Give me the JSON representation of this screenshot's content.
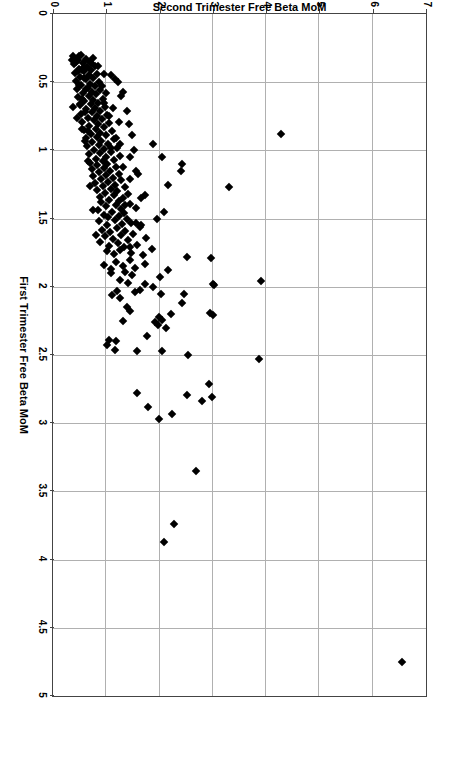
{
  "figure": {
    "rotation_note": "page-rotated-90-clockwise",
    "background": "#ffffff",
    "frame_color": "#444444",
    "grid_color": "#b0b0b0",
    "marker_color": "#000000"
  },
  "chart_data": {
    "type": "scatter",
    "title": "",
    "xlabel": "First Trimester Free Beta MoM",
    "ylabel": "Second Trimester Free Beta MoM",
    "xlim": [
      0,
      5
    ],
    "ylim": [
      0,
      7
    ],
    "xticks": [
      "0",
      "0.5",
      "1",
      "1.5",
      "2",
      "2.5",
      "3",
      "3.5",
      "4",
      "4.5",
      "5"
    ],
    "xtick_values": [
      0,
      0.5,
      1,
      1.5,
      2,
      2.5,
      3,
      3.5,
      4,
      4.5,
      5
    ],
    "yticks": [
      "0",
      "1",
      "2",
      "3",
      "4",
      "5",
      "6",
      "7"
    ],
    "ytick_values": [
      0,
      1,
      2,
      3,
      4,
      5,
      6,
      7
    ],
    "grid": true,
    "legend": null,
    "marker": "diamond",
    "marker_size_px": 6,
    "n_points": 268,
    "points": [
      [
        4.75,
        6.55
      ],
      [
        3.87,
        2.08
      ],
      [
        3.74,
        2.28
      ],
      [
        3.35,
        2.68
      ],
      [
        2.97,
        1.99
      ],
      [
        2.93,
        2.24
      ],
      [
        2.88,
        1.79
      ],
      [
        2.84,
        2.79
      ],
      [
        2.81,
        2.99
      ],
      [
        2.79,
        2.51
      ],
      [
        2.78,
        1.58
      ],
      [
        2.71,
        2.92
      ],
      [
        2.53,
        3.87
      ],
      [
        2.5,
        2.54
      ],
      [
        2.47,
        2.05
      ],
      [
        2.47,
        1.57
      ],
      [
        2.46,
        1.17
      ],
      [
        2.43,
        1.02
      ],
      [
        2.4,
        1.18
      ],
      [
        2.39,
        1.05
      ],
      [
        2.36,
        1.77
      ],
      [
        2.3,
        2.12
      ],
      [
        2.28,
        1.97
      ],
      [
        2.26,
        1.92
      ],
      [
        2.25,
        1.32
      ],
      [
        2.24,
        2.04
      ],
      [
        2.22,
        1.98
      ],
      [
        2.21,
        3.01
      ],
      [
        2.19,
        2.94
      ],
      [
        2.18,
        1.44
      ],
      [
        2.15,
        1.38
      ],
      [
        2.12,
        2.43
      ],
      [
        2.08,
        1.26
      ],
      [
        2.06,
        1.1
      ],
      [
        2.05,
        2.46
      ],
      [
        2.05,
        2.02
      ],
      [
        2.04,
        1.53
      ],
      [
        2.03,
        1.21
      ],
      [
        2.02,
        1.63
      ],
      [
        2.0,
        1.88
      ],
      [
        1.99,
        3.03
      ],
      [
        1.98,
        1.73
      ],
      [
        1.97,
        1.41
      ],
      [
        1.96,
        3.91
      ],
      [
        1.95,
        1.25
      ],
      [
        1.93,
        2.01
      ],
      [
        1.91,
        1.49
      ],
      [
        1.9,
        1.09
      ],
      [
        1.89,
        1.36
      ],
      [
        1.88,
        2.16
      ],
      [
        1.87,
        1.08
      ],
      [
        1.86,
        1.54
      ],
      [
        1.85,
        1.31
      ],
      [
        1.84,
        0.95
      ],
      [
        1.83,
        1.72
      ],
      [
        1.82,
        1.19
      ],
      [
        1.8,
        1.44
      ],
      [
        1.79,
        2.97
      ],
      [
        1.78,
        2.52
      ],
      [
        1.77,
        1.69
      ],
      [
        1.76,
        1.14
      ],
      [
        1.75,
        1.46
      ],
      [
        1.74,
        1.02
      ],
      [
        1.73,
        1.25
      ],
      [
        1.72,
        1.85
      ],
      [
        1.71,
        1.34
      ],
      [
        1.7,
        1.05
      ],
      [
        1.69,
        1.58
      ],
      [
        1.68,
        1.22
      ],
      [
        1.67,
        0.89
      ],
      [
        1.66,
        1.41
      ],
      [
        1.65,
        1.13
      ],
      [
        1.64,
        1.74
      ],
      [
        1.63,
        0.98
      ],
      [
        1.62,
        1.28
      ],
      [
        1.61,
        1.51
      ],
      [
        1.6,
        1.07
      ],
      [
        1.59,
        1.36
      ],
      [
        1.58,
        0.92
      ],
      [
        1.57,
        1.2
      ],
      [
        1.56,
        1.63
      ],
      [
        1.55,
        1.01
      ],
      [
        1.54,
        1.3
      ],
      [
        1.53,
        1.47
      ],
      [
        1.52,
        0.87
      ],
      [
        1.51,
        1.16
      ],
      [
        1.5,
        1.39
      ],
      [
        1.49,
        1.04
      ],
      [
        1.48,
        1.24
      ],
      [
        1.47,
        0.96
      ],
      [
        1.46,
        1.33
      ],
      [
        1.45,
        1.1
      ],
      [
        1.44,
        0.84
      ],
      [
        1.43,
        1.27
      ],
      [
        1.42,
        1.55
      ],
      [
        1.41,
        0.99
      ],
      [
        1.4,
        1.18
      ],
      [
        1.39,
        1.44
      ],
      [
        1.38,
        0.91
      ],
      [
        1.37,
        1.23
      ],
      [
        1.36,
        1.06
      ],
      [
        1.35,
        1.31
      ],
      [
        1.34,
        0.88
      ],
      [
        1.33,
        1.15
      ],
      [
        1.32,
        1.4
      ],
      [
        1.31,
        0.97
      ],
      [
        1.3,
        1.21
      ],
      [
        1.29,
        0.82
      ],
      [
        1.28,
        1.09
      ],
      [
        1.27,
        1.35
      ],
      [
        1.26,
        0.94
      ],
      [
        1.25,
        1.17
      ],
      [
        1.24,
        0.79
      ],
      [
        1.23,
        1.03
      ],
      [
        1.22,
        1.28
      ],
      [
        1.21,
        0.9
      ],
      [
        1.2,
        1.12
      ],
      [
        1.19,
        0.76
      ],
      [
        1.18,
        1.0
      ],
      [
        1.17,
        1.24
      ],
      [
        1.16,
        0.86
      ],
      [
        1.15,
        1.07
      ],
      [
        1.14,
        0.73
      ],
      [
        1.13,
        0.96
      ],
      [
        1.12,
        1.19
      ],
      [
        1.11,
        0.83
      ],
      [
        1.1,
        1.02
      ],
      [
        1.09,
        0.7
      ],
      [
        1.08,
        0.93
      ],
      [
        1.07,
        1.14
      ],
      [
        1.06,
        0.8
      ],
      [
        1.05,
        0.99
      ],
      [
        1.04,
        1.26
      ],
      [
        1.03,
        0.67
      ],
      [
        1.02,
        0.89
      ],
      [
        1.01,
        1.09
      ],
      [
        1.0,
        0.77
      ],
      [
        0.99,
        0.95
      ],
      [
        0.98,
        1.2
      ],
      [
        0.97,
        0.64
      ],
      [
        0.96,
        0.86
      ],
      [
        0.95,
        1.04
      ],
      [
        0.94,
        0.74
      ],
      [
        0.93,
        0.91
      ],
      [
        0.92,
        1.15
      ],
      [
        0.91,
        0.61
      ],
      [
        0.9,
        0.83
      ],
      [
        0.89,
        1.0
      ],
      [
        0.88,
        0.71
      ],
      [
        0.87,
        0.88
      ],
      [
        0.86,
        1.1
      ],
      [
        0.85,
        0.58
      ],
      [
        0.84,
        0.8
      ],
      [
        0.83,
        0.96
      ],
      [
        0.82,
        0.68
      ],
      [
        0.81,
        0.85
      ],
      [
        0.8,
        1.05
      ],
      [
        0.79,
        0.55
      ],
      [
        0.78,
        0.77
      ],
      [
        0.77,
        0.92
      ],
      [
        0.76,
        0.65
      ],
      [
        0.75,
        0.82
      ],
      [
        0.74,
        1.01
      ],
      [
        0.73,
        0.52
      ],
      [
        0.72,
        0.74
      ],
      [
        0.71,
        0.88
      ],
      [
        0.7,
        0.62
      ],
      [
        0.69,
        0.79
      ],
      [
        0.68,
        0.97
      ],
      [
        0.67,
        0.5
      ],
      [
        0.66,
        0.71
      ],
      [
        0.65,
        0.85
      ],
      [
        0.64,
        0.59
      ],
      [
        0.63,
        0.76
      ],
      [
        0.62,
        0.93
      ],
      [
        0.61,
        0.47
      ],
      [
        0.6,
        0.68
      ],
      [
        0.59,
        0.81
      ],
      [
        0.58,
        0.56
      ],
      [
        0.57,
        0.73
      ],
      [
        0.56,
        0.89
      ],
      [
        0.55,
        0.45
      ],
      [
        0.54,
        0.65
      ],
      [
        0.53,
        0.78
      ],
      [
        0.52,
        0.53
      ],
      [
        0.51,
        0.7
      ],
      [
        0.5,
        0.86
      ],
      [
        0.49,
        0.43
      ],
      [
        0.48,
        0.62
      ],
      [
        0.47,
        0.75
      ],
      [
        0.46,
        0.51
      ],
      [
        0.45,
        0.67
      ],
      [
        0.44,
        0.82
      ],
      [
        0.43,
        0.41
      ],
      [
        0.42,
        0.59
      ],
      [
        0.41,
        0.72
      ],
      [
        0.4,
        0.49
      ],
      [
        0.39,
        0.64
      ],
      [
        0.38,
        0.78
      ],
      [
        0.37,
        0.39
      ],
      [
        0.36,
        0.56
      ],
      [
        0.35,
        0.69
      ],
      [
        0.34,
        0.47
      ],
      [
        0.33,
        0.61
      ],
      [
        0.32,
        0.75
      ],
      [
        0.31,
        0.37
      ],
      [
        0.3,
        0.53
      ],
      [
        0.88,
        4.27
      ],
      [
        1.27,
        3.3
      ],
      [
        1.98,
        3.0
      ],
      [
        2.2,
        2.22
      ],
      [
        1.5,
        1.95
      ],
      [
        1.4,
        1.35
      ],
      [
        1.15,
        1.55
      ],
      [
        1.05,
        1.45
      ],
      [
        0.95,
        1.25
      ],
      [
        0.75,
        1.05
      ],
      [
        0.65,
        0.95
      ],
      [
        1.55,
        1.65
      ],
      [
        1.33,
        1.72
      ],
      [
        1.21,
        1.44
      ],
      [
        1.12,
        1.32
      ],
      [
        0.98,
        1.08
      ],
      [
        0.91,
        1.18
      ],
      [
        0.86,
        0.66
      ],
      [
        0.79,
        1.24
      ],
      [
        0.72,
        0.6
      ],
      [
        0.69,
        1.12
      ],
      [
        0.58,
        1.0
      ],
      [
        0.53,
        0.92
      ],
      [
        0.5,
        1.22
      ],
      [
        0.47,
        0.58
      ],
      [
        0.44,
        0.95
      ],
      [
        0.41,
        0.54
      ],
      [
        0.38,
        0.85
      ],
      [
        0.35,
        0.44
      ],
      [
        0.6,
        1.28
      ],
      [
        0.55,
        0.62
      ],
      [
        0.48,
        1.16
      ],
      [
        0.42,
        0.46
      ],
      [
        0.36,
        0.72
      ],
      [
        0.33,
        0.42
      ],
      [
        0.62,
        0.55
      ],
      [
        0.57,
        1.32
      ],
      [
        0.52,
        0.48
      ],
      [
        0.45,
        1.08
      ],
      [
        0.39,
        0.58
      ],
      [
        0.34,
        0.35
      ],
      [
        0.66,
        0.5
      ],
      [
        0.71,
        1.38
      ],
      [
        0.76,
        0.45
      ],
      [
        0.81,
        1.42
      ],
      [
        0.84,
        0.55
      ],
      [
        0.89,
        1.48
      ],
      [
        0.93,
        0.6
      ],
      [
        1.0,
        1.52
      ],
      [
        1.08,
        0.66
      ],
      [
        1.17,
        1.6
      ],
      [
        1.26,
        0.7
      ],
      [
        1.35,
        1.66
      ],
      [
        1.44,
        0.75
      ],
      [
        1.53,
        1.56
      ],
      [
        1.62,
        0.8
      ],
      [
        1.71,
        1.45
      ],
      [
        1.45,
        2.08
      ],
      [
        1.25,
        2.15
      ],
      [
        1.15,
        2.4
      ],
      [
        1.1,
        2.42
      ],
      [
        1.05,
        2.05
      ],
      [
        0.95,
        1.87
      ],
      [
        0.68,
        0.38
      ],
      [
        0.31,
        0.48
      ]
    ]
  },
  "axes": {
    "x_title": "First Trimester Free Beta MoM",
    "y_title": "Second Trimester Free Beta MoM"
  }
}
